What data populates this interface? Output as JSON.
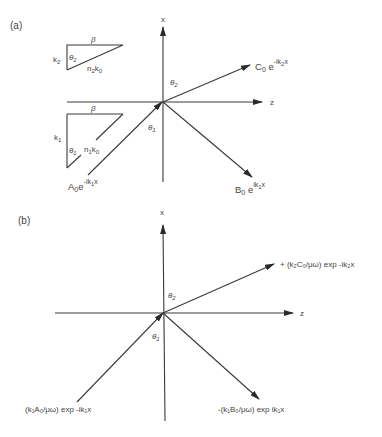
{
  "panels": [
    {
      "id": "a",
      "label": "(a)",
      "axes": {
        "vertical": "x",
        "horizontal": "z"
      },
      "angles": {
        "theta1": "θ1",
        "theta2": "θ2"
      },
      "incident_wave": {
        "coef": "A",
        "coef_sub": "0",
        "exp_base": "e",
        "exponent": "-ik",
        "exponent_sub": "1",
        "exponent_var": "x"
      },
      "reflected_wave": {
        "coef": "B",
        "coef_sub": "0",
        "exp_base": "e",
        "exponent": "ik",
        "exponent_sub": "1",
        "exponent_var": "x"
      },
      "transmitted_wave": {
        "coef": "C",
        "coef_sub": "0",
        "exp_base": "e",
        "exponent": "-ik",
        "exponent_sub": "2",
        "exponent_var": "x"
      },
      "triangle_upper": {
        "top": "β",
        "left": "k",
        "left_sub": "2",
        "angle": "θ",
        "angle_sub": "2",
        "hyp": "n",
        "hyp_sub": "2",
        "hyp2": "k",
        "hyp2_sub": "0"
      },
      "triangle_lower": {
        "top": "β",
        "left": "k",
        "left_sub": "1",
        "angle": "θ",
        "angle_sub": "1",
        "hyp": "n",
        "hyp_sub": "1",
        "hyp2": "k",
        "hyp2_sub": "0"
      }
    },
    {
      "id": "b",
      "label": "(b)",
      "axes": {
        "vertical": "x",
        "horizontal": "z"
      },
      "angles": {
        "theta1": "θ1",
        "theta2": "θ2"
      },
      "incident_wave": "(k₁A₀/μω) exp -ik₁x",
      "reflected_wave": "-(k₁B₀/μω) exp ik₁x",
      "transmitted_wave": "+ (k₂C₀/μω) exp -ik₂x"
    }
  ]
}
